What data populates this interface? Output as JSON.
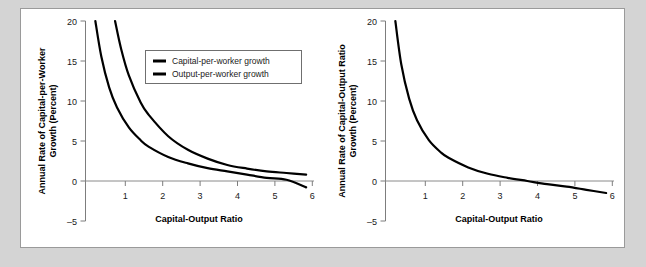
{
  "figure": {
    "background_color": "#d4d4d4",
    "panel_color": "#ffffff",
    "panel_border_color": "#9a9a9a",
    "curve_color": "#000000"
  },
  "chart_data": [
    {
      "type": "line",
      "id": "left",
      "title": "",
      "xlabel": "Capital-Output Ratio",
      "ylabel": "Annual Rate of Capital-per-Worker Growth (Percent)",
      "xlim": [
        0.4,
        6.2
      ],
      "ylim": [
        -5,
        20
      ],
      "xticks": [
        1,
        2,
        3,
        4,
        5,
        6
      ],
      "xtick_labels": [
        "1",
        "2",
        "3",
        "4",
        "5",
        "6"
      ],
      "yticks": [
        -5,
        0,
        5,
        10,
        15,
        20
      ],
      "ytick_labels": [
        "–5",
        "0",
        "5",
        "10",
        "15",
        "20"
      ],
      "grid": false,
      "zero_line": true,
      "legend_position": "upper-center",
      "series": [
        {
          "name": "Capital-per-worker growth",
          "x": [
            0.65,
            0.8,
            1.0,
            1.2,
            1.5,
            1.8,
            2.0,
            2.5,
            3.0,
            3.5,
            4.0,
            4.5,
            5.0,
            5.5,
            6.0
          ],
          "values": [
            20.0,
            15.6,
            11.7,
            9.2,
            6.7,
            5.1,
            4.3,
            3.0,
            2.2,
            1.6,
            1.2,
            0.8,
            0.4,
            0.15,
            -0.8
          ]
        },
        {
          "name": "Output-per-worker growth",
          "x": [
            1.15,
            1.3,
            1.5,
            1.8,
            2.0,
            2.5,
            3.0,
            3.5,
            4.0,
            4.5,
            5.0,
            5.5,
            6.0
          ],
          "values": [
            20.0,
            16.6,
            13.2,
            9.8,
            8.3,
            5.6,
            3.9,
            2.8,
            2.0,
            1.55,
            1.2,
            1.0,
            0.8
          ]
        }
      ]
    },
    {
      "type": "line",
      "id": "right",
      "title": "",
      "xlabel": "Capital-Output Ratio",
      "ylabel": "Annual Rate of Capital-Output Ratio Growth (Percent)",
      "xlim": [
        0.4,
        6.2
      ],
      "ylim": [
        -5,
        20
      ],
      "xticks": [
        1,
        2,
        3,
        4,
        5,
        6
      ],
      "xtick_labels": [
        "1",
        "2",
        "3",
        "4",
        "5",
        "6"
      ],
      "yticks": [
        -5,
        0,
        5,
        10,
        15,
        20
      ],
      "ytick_labels": [
        "–5",
        "0",
        "5",
        "10",
        "15",
        "20"
      ],
      "grid": false,
      "zero_line": true,
      "legend_position": "none",
      "series": [
        {
          "name": "Capital-Output ratio growth",
          "x": [
            0.65,
            0.8,
            1.0,
            1.2,
            1.5,
            1.8,
            2.0,
            2.5,
            3.0,
            3.5,
            4.0,
            4.5,
            5.0,
            5.5,
            6.0
          ],
          "values": [
            20.0,
            14.6,
            10.3,
            7.6,
            5.1,
            3.6,
            2.9,
            1.7,
            0.9,
            0.4,
            0.0,
            -0.4,
            -0.7,
            -1.1,
            -1.5
          ]
        }
      ]
    }
  ]
}
